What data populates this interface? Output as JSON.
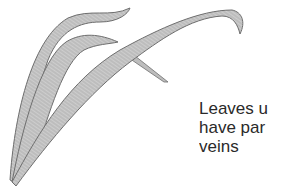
{
  "figure": {
    "colors": {
      "leaf_fill": "#bdbdbd",
      "leaf_outline": "#6e6e6e",
      "vein": "#e6e6e6",
      "text": "#2a2a2a",
      "background": "#ffffff"
    }
  },
  "caption": {
    "lines": [
      "Leaves u",
      "have par",
      "veins"
    ]
  }
}
